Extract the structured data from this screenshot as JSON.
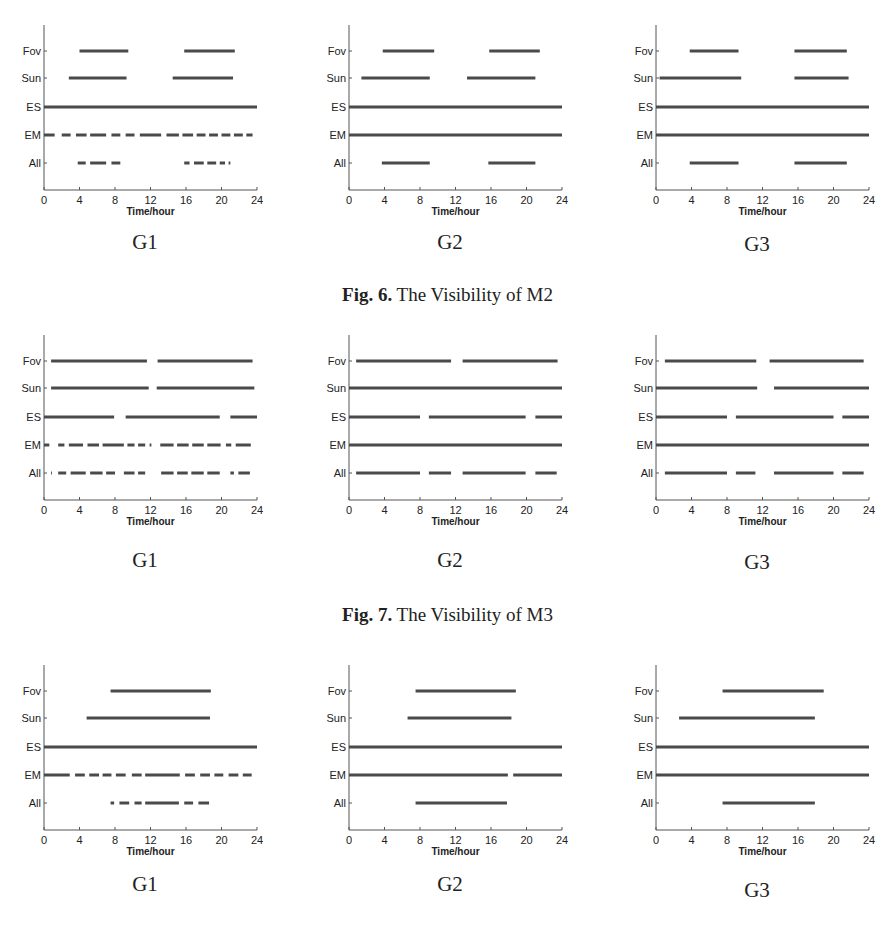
{
  "figures": [
    {
      "caption_bold": "Fig. 6.",
      "caption_text": " The Visibility of M2",
      "panels": [
        {
          "label": "G1"
        },
        {
          "label": "G2"
        },
        {
          "label": "G3"
        }
      ]
    },
    {
      "caption_bold": "Fig. 7.",
      "caption_text": " The Visibility of M3",
      "panels": [
        {
          "label": "G1"
        },
        {
          "label": "G2"
        },
        {
          "label": "G3"
        }
      ]
    },
    {
      "caption_bold": "",
      "caption_text": "",
      "panels": [
        {
          "label": "G1"
        },
        {
          "label": "G2"
        },
        {
          "label": "G3"
        }
      ]
    }
  ],
  "axis": {
    "xlabel": "Time/hour",
    "xticks": [
      "0",
      "4",
      "8",
      "12",
      "16",
      "20",
      "24"
    ],
    "ylabels": [
      "Fov",
      "Sun",
      "ES",
      "EM",
      "All"
    ]
  },
  "colors": {
    "line": "#4a4a4a",
    "axis": "#555555",
    "text": "#222222"
  },
  "chart_data": [
    {
      "type": "timeline",
      "title": "Fig. 6. The Visibility of M2 — G1",
      "xlabel": "Time/hour",
      "xlim": [
        0,
        24
      ],
      "rows": {
        "Fov": [
          [
            4,
            9.5
          ],
          [
            15.8,
            21.5
          ]
        ],
        "Sun": [
          [
            2.8,
            9.3
          ],
          [
            14.5,
            21.3
          ]
        ],
        "ES": [
          [
            0,
            24
          ]
        ],
        "EM": [
          [
            0,
            1.2
          ],
          [
            2,
            3
          ],
          [
            3.6,
            4.8
          ],
          [
            5.2,
            7
          ],
          [
            7.6,
            8.6
          ],
          [
            9.2,
            10.2
          ],
          [
            10.8,
            13.2
          ],
          [
            13.8,
            15.2
          ],
          [
            15.6,
            16.8
          ],
          [
            17.2,
            18.2
          ],
          [
            18.6,
            19.6
          ],
          [
            20,
            21
          ],
          [
            21.4,
            22.4
          ],
          [
            22.8,
            23.5
          ]
        ],
        "All": [
          [
            3.8,
            4.7
          ],
          [
            5.2,
            7
          ],
          [
            7.6,
            8.6
          ],
          [
            15.8,
            16.4
          ],
          [
            16.9,
            18
          ],
          [
            18.4,
            19.4
          ],
          [
            19.8,
            20.4
          ],
          [
            20.8,
            21
          ]
        ]
      }
    },
    {
      "type": "timeline",
      "title": "Fig. 6. The Visibility of M2 — G2",
      "xlabel": "Time/hour",
      "xlim": [
        0,
        24
      ],
      "rows": {
        "Fov": [
          [
            3.8,
            9.6
          ],
          [
            15.8,
            21.5
          ]
        ],
        "Sun": [
          [
            1.4,
            9.1
          ],
          [
            13.3,
            21
          ]
        ],
        "ES": [
          [
            0,
            24
          ]
        ],
        "EM": [
          [
            0,
            24
          ]
        ],
        "All": [
          [
            3.7,
            9.1
          ],
          [
            15.7,
            21
          ]
        ]
      }
    },
    {
      "type": "timeline",
      "title": "Fig. 6. The Visibility of M2 — G3",
      "xlabel": "Time/hour",
      "xlim": [
        0,
        24
      ],
      "rows": {
        "Fov": [
          [
            3.8,
            9.3
          ],
          [
            15.6,
            21.5
          ]
        ],
        "Sun": [
          [
            0.4,
            9.6
          ],
          [
            15.6,
            21.7
          ]
        ],
        "ES": [
          [
            0,
            24
          ]
        ],
        "EM": [
          [
            0,
            24
          ]
        ],
        "All": [
          [
            3.8,
            9.3
          ],
          [
            15.6,
            21.5
          ]
        ]
      }
    },
    {
      "type": "timeline",
      "title": "Fig. 7. The Visibility of M3 — G1",
      "xlabel": "Time/hour",
      "xlim": [
        0,
        24
      ],
      "rows": {
        "Fov": [
          [
            0.8,
            11.6
          ],
          [
            12.8,
            23.5
          ]
        ],
        "Sun": [
          [
            0.8,
            11.8
          ],
          [
            12.7,
            23.7
          ]
        ],
        "ES": [
          [
            0,
            7.9
          ],
          [
            9.2,
            19.8
          ],
          [
            21,
            24
          ]
        ],
        "EM": [
          [
            0,
            0.6
          ],
          [
            1.6,
            2.3
          ],
          [
            2.8,
            4.4
          ],
          [
            4.9,
            6.2
          ],
          [
            6.6,
            9
          ],
          [
            9.4,
            10.2
          ],
          [
            10.6,
            11.4
          ],
          [
            11.9,
            12.1
          ],
          [
            13.1,
            14.6
          ],
          [
            15,
            16.3
          ],
          [
            16.7,
            18
          ],
          [
            18.4,
            19.9
          ],
          [
            20.5,
            21.1
          ],
          [
            21.6,
            23.3
          ]
        ],
        "All": [
          [
            0.8,
            0.9
          ],
          [
            1.6,
            2.5
          ],
          [
            3,
            4.7
          ],
          [
            5.2,
            6.6
          ],
          [
            7,
            8
          ],
          [
            9,
            10.2
          ],
          [
            10.6,
            11.4
          ],
          [
            13.2,
            14.6
          ],
          [
            15,
            16.2
          ],
          [
            16.6,
            18
          ],
          [
            18.4,
            19.8
          ],
          [
            21,
            21.4
          ],
          [
            21.9,
            23.2
          ]
        ]
      }
    },
    {
      "type": "timeline",
      "title": "Fig. 7. The Visibility of M3 — G2",
      "xlabel": "Time/hour",
      "xlim": [
        0,
        24
      ],
      "rows": {
        "Fov": [
          [
            0.8,
            11.5
          ],
          [
            12.8,
            23.5
          ]
        ],
        "Sun": [
          [
            0,
            24
          ]
        ],
        "ES": [
          [
            0,
            8
          ],
          [
            9,
            19.9
          ],
          [
            21,
            24
          ]
        ],
        "EM": [
          [
            0,
            24
          ]
        ],
        "All": [
          [
            0.8,
            8
          ],
          [
            9,
            11.5
          ],
          [
            12.8,
            19.9
          ],
          [
            21,
            23.4
          ]
        ]
      }
    },
    {
      "type": "timeline",
      "title": "Fig. 7. The Visibility of M3 — G3",
      "xlabel": "Time/hour",
      "xlim": [
        0,
        24
      ],
      "rows": {
        "Fov": [
          [
            1,
            11.3
          ],
          [
            12.8,
            23.4
          ]
        ],
        "Sun": [
          [
            0,
            11.4
          ],
          [
            13.3,
            24
          ]
        ],
        "ES": [
          [
            0,
            8
          ],
          [
            9,
            20
          ],
          [
            21,
            24
          ]
        ],
        "EM": [
          [
            0,
            24
          ]
        ],
        "All": [
          [
            1,
            8
          ],
          [
            9,
            11.2
          ],
          [
            13.3,
            20
          ],
          [
            21,
            23.4
          ]
        ]
      }
    },
    {
      "type": "timeline",
      "title": "Figure 8 (caption not visible) — G1",
      "xlabel": "Time/hour",
      "xlim": [
        0,
        24
      ],
      "rows": {
        "Fov": [
          [
            7.5,
            18.8
          ]
        ],
        "Sun": [
          [
            4.8,
            18.7
          ]
        ],
        "ES": [
          [
            0,
            24
          ]
        ],
        "EM": [
          [
            0,
            2.9
          ],
          [
            3.5,
            4.6
          ],
          [
            5.1,
            6.2
          ],
          [
            6.6,
            7.6
          ],
          [
            8.1,
            9.2
          ],
          [
            9.9,
            11
          ],
          [
            11.4,
            15.3
          ],
          [
            15.9,
            17
          ],
          [
            17.6,
            18.7
          ],
          [
            19.2,
            20.2
          ],
          [
            20.8,
            21.9
          ],
          [
            22.4,
            23.4
          ]
        ],
        "All": [
          [
            7.5,
            7.9
          ],
          [
            8.5,
            9.6
          ],
          [
            10.2,
            11
          ],
          [
            11.4,
            15.2
          ],
          [
            15.8,
            16.8
          ],
          [
            17.4,
            18.6
          ]
        ]
      }
    },
    {
      "type": "timeline",
      "title": "Figure 8 (caption not visible) — G2",
      "xlabel": "Time/hour",
      "xlim": [
        0,
        24
      ],
      "rows": {
        "Fov": [
          [
            7.5,
            18.8
          ]
        ],
        "Sun": [
          [
            6.6,
            18.3
          ]
        ],
        "ES": [
          [
            0,
            24
          ]
        ],
        "EM": [
          [
            0,
            17.9
          ],
          [
            18.5,
            24
          ]
        ],
        "All": [
          [
            7.5,
            17.8
          ]
        ]
      }
    },
    {
      "type": "timeline",
      "title": "Figure 8 (caption not visible) — G3",
      "xlabel": "Time/hour",
      "xlim": [
        0,
        24
      ],
      "rows": {
        "Fov": [
          [
            7.5,
            18.9
          ]
        ],
        "Sun": [
          [
            2.6,
            17.9
          ]
        ],
        "ES": [
          [
            0,
            24
          ]
        ],
        "EM": [
          [
            0,
            24
          ]
        ],
        "All": [
          [
            7.5,
            17.9
          ]
        ]
      }
    }
  ]
}
